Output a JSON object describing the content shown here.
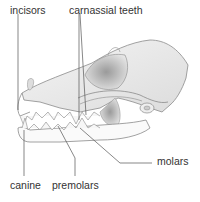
{
  "diagram": {
    "labels": {
      "incisors": "incisors",
      "carnassial": "carnassial teeth",
      "molars": "molars",
      "canine": "canine",
      "premolars": "premolars"
    },
    "colors": {
      "outline": "#8a8a8a",
      "shade": "#c8c8c8",
      "leader": "#555555",
      "text": "#333333"
    }
  }
}
